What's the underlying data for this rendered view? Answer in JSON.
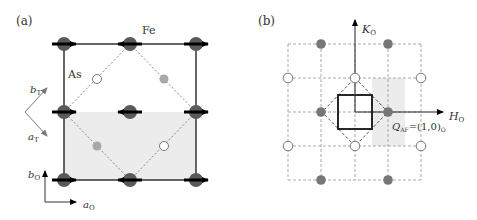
{
  "panel_a": {
    "label": "(a)",
    "fe_label": "Fe",
    "as_label": "As",
    "axes": {
      "bT": "b",
      "bT_sub": "T",
      "aT": "a",
      "aT_sub": "T",
      "bO": "b",
      "bO_sub": "O",
      "aO": "a",
      "aO_sub": "O"
    },
    "colors": {
      "fe": "#5a5a5a",
      "as_gray": "#a8a8a8",
      "shade": "#ececec",
      "line": "#333333",
      "dash": "#888888",
      "arrow": "#000000"
    },
    "fe_atoms": [
      {
        "x": 64,
        "y": 44,
        "dir": "right"
      },
      {
        "x": 130,
        "y": 44,
        "dir": "left"
      },
      {
        "x": 196,
        "y": 44,
        "dir": "right"
      },
      {
        "x": 64,
        "y": 112,
        "dir": "right"
      },
      {
        "x": 130,
        "y": 112,
        "dir": "left"
      },
      {
        "x": 196,
        "y": 112,
        "dir": "right"
      },
      {
        "x": 64,
        "y": 180,
        "dir": "right"
      },
      {
        "x": 130,
        "y": 180,
        "dir": "left"
      },
      {
        "x": 196,
        "y": 180,
        "dir": "right"
      }
    ],
    "as_atoms": [
      {
        "x": 97,
        "y": 79,
        "type": "open"
      },
      {
        "x": 164,
        "y": 79,
        "type": "filled"
      },
      {
        "x": 97,
        "y": 146,
        "type": "filled"
      },
      {
        "x": 164,
        "y": 146,
        "type": "open"
      }
    ]
  },
  "panel_b": {
    "label": "(b)",
    "k_axis": "K",
    "k_sub": "O",
    "h_axis": "H",
    "h_sub": "O",
    "q_label": "Q",
    "q_sub": "AF",
    "q_value": "=(1,0)",
    "q_value_sub": "O",
    "grid_x": [
      288,
      321,
      355,
      388,
      421
    ],
    "grid_y": [
      44,
      78,
      112,
      146,
      180
    ],
    "filled_points": [
      [
        321,
        44
      ],
      [
        388,
        44
      ],
      [
        321,
        112
      ],
      [
        388,
        112
      ],
      [
        321,
        180
      ],
      [
        388,
        180
      ]
    ],
    "open_points": [
      [
        288,
        78
      ],
      [
        355,
        78
      ],
      [
        421,
        78
      ],
      [
        288,
        146
      ],
      [
        355,
        146
      ],
      [
        421,
        146
      ]
    ],
    "colors": {
      "filled": "#777777",
      "grid": "#aaaaaa",
      "shade": "#ececec"
    }
  }
}
